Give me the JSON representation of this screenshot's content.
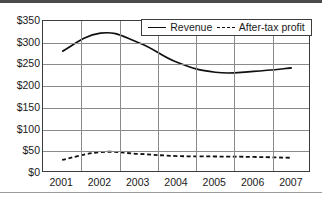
{
  "chart_data": {
    "type": "line",
    "title": "",
    "xlabel": "",
    "ylabel": "",
    "categories": [
      "2001",
      "2002",
      "2003",
      "2004",
      "2005",
      "2006",
      "2007"
    ],
    "ytick_labels": [
      "$0",
      "$50",
      "$100",
      "$150",
      "$200",
      "$250",
      "$300",
      "$350"
    ],
    "ytick_values": [
      0,
      50,
      100,
      150,
      200,
      250,
      300,
      350
    ],
    "ylim": [
      0,
      350
    ],
    "grid": "both",
    "legend_position": "top-right-inside",
    "series": [
      {
        "name": "Revenue",
        "style": "solid",
        "color": "#101010",
        "values": [
          280,
          322,
          300,
          255,
          232,
          234,
          242
        ]
      },
      {
        "name": "After-tax profit",
        "style": "dashed",
        "color": "#101010",
        "values": [
          30,
          48,
          44,
          39,
          38,
          37,
          35
        ]
      }
    ]
  },
  "legend": {
    "entries": [
      {
        "label": "Revenue"
      },
      {
        "label": "After-tax profit"
      }
    ]
  }
}
